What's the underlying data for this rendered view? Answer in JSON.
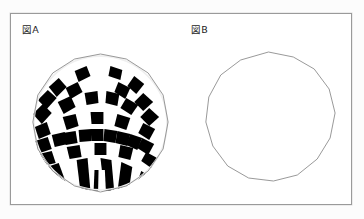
{
  "page": {
    "background_color": "#fcfcfc",
    "frame_border_color": "#9a9a9a",
    "ink_color": "#000000"
  },
  "figures": [
    {
      "id": "figure-a",
      "label": "図A",
      "type": "checkerboard-sphere",
      "description": "Sphere rendered as a faceted polyhedron with a black-and-white checkerboard texture; the upper polar cap is blank white and the lower pole shows radially converging wedges.",
      "outline_sides": 16,
      "fill_pattern": "checkerboard",
      "pattern_colors": [
        "#000000",
        "#ffffff"
      ],
      "outline_color": "#8d8d8d",
      "center": {
        "x": 90,
        "y": 109
      },
      "radius": {
        "x": 68,
        "y": 69
      },
      "latitude_bands": 9,
      "longitude_bands": 16,
      "blank_cap_top_bands": 2
    },
    {
      "id": "figure-b",
      "label": "図B",
      "type": "empty-polygon",
      "description": "Plain unfilled polygon outline approximating a circle, same size as figure A.",
      "outline_sides": 14,
      "fill_pattern": "none",
      "fill_color": "#ffffff",
      "outline_color": "#8d8d8d",
      "center": {
        "x": 90,
        "y": 107
      },
      "radius": {
        "x": 68,
        "y": 69
      }
    }
  ]
}
